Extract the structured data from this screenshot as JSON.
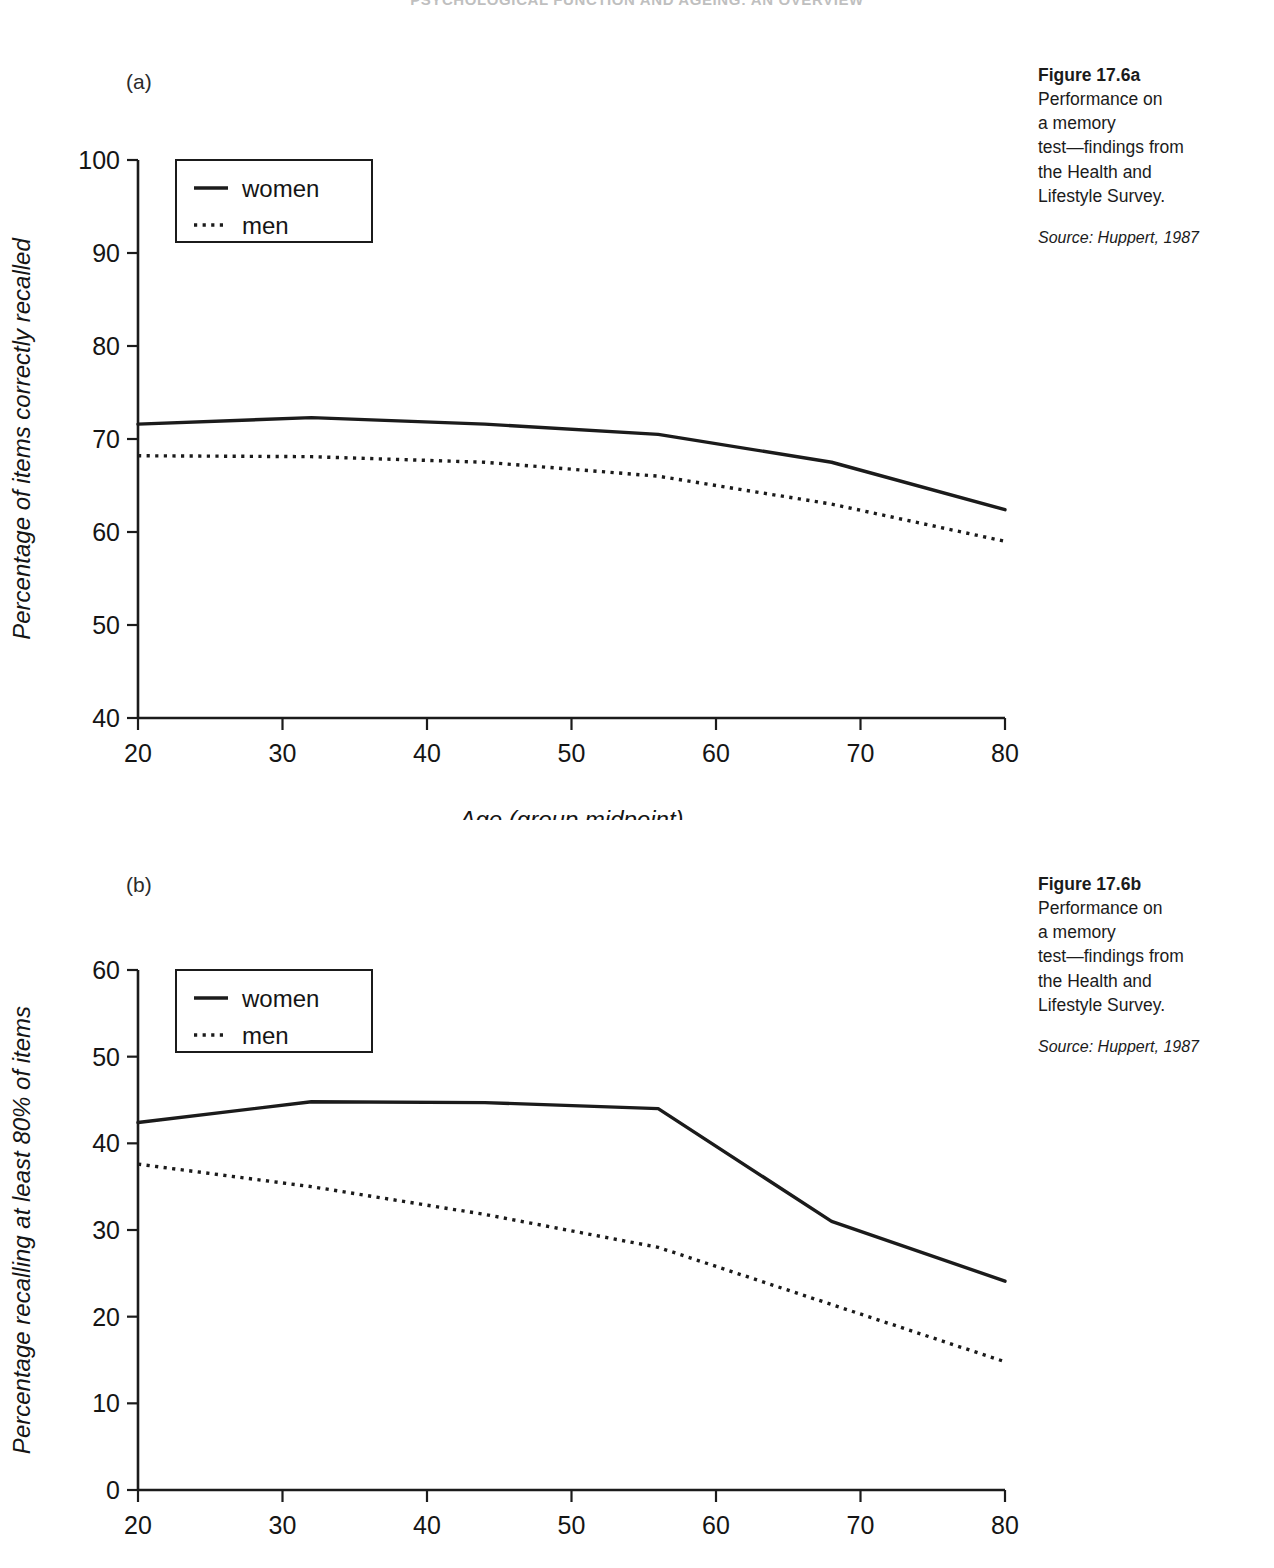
{
  "running_head": "PSYCHOLOGICAL FUNCTION AND AGEING: AN OVERVIEW",
  "panels": {
    "a": {
      "label": "(a)"
    },
    "b": {
      "label": "(b)"
    }
  },
  "captions": {
    "a": {
      "title": "Figure 17.6a",
      "body": "Performance on\na memory\ntest—findings from\nthe Health and\nLifestyle Survey.",
      "source": "Source: Huppert, 1987"
    },
    "b": {
      "title": "Figure 17.6b",
      "body": "Performance on\na memory\ntest—findings from\nthe Health and\nLifestyle Survey.",
      "source": "Source: Huppert, 1987"
    }
  },
  "legend": {
    "women": "women",
    "men": "men"
  },
  "axis_ticks": {
    "x": [
      "20",
      "30",
      "40",
      "50",
      "60",
      "70",
      "80"
    ],
    "y_a": [
      "40",
      "50",
      "60",
      "70",
      "80",
      "90",
      "100"
    ],
    "y_b": [
      "0",
      "10",
      "20",
      "30",
      "40",
      "50",
      "60"
    ]
  },
  "colors": {
    "ink": "#1b1b1b",
    "running_head": "#bfbfbf",
    "background": "#ffffff"
  },
  "chart_data": [
    {
      "id": "figure-17-6a",
      "type": "line",
      "title": "Figure 17.6a",
      "panel": "(a)",
      "xlabel": "Age (group midpoint)",
      "ylabel": "Percentage of items correctly recalled",
      "xlim": [
        20,
        80
      ],
      "ylim": [
        40,
        100
      ],
      "xticks": [
        20,
        30,
        40,
        50,
        60,
        70,
        80
      ],
      "yticks": [
        40,
        50,
        60,
        70,
        80,
        90,
        100
      ],
      "grid": false,
      "legend_position": "upper-left",
      "x": [
        20,
        32,
        44,
        56,
        68,
        80
      ],
      "series": [
        {
          "name": "women",
          "style": "solid",
          "values": [
            71.6,
            72.3,
            71.6,
            70.5,
            67.5,
            62.4
          ]
        },
        {
          "name": "men",
          "style": "dotted",
          "values": [
            68.2,
            68.1,
            67.5,
            66.0,
            63.0,
            59.0
          ]
        }
      ],
      "source": "Source: Huppert, 1987"
    },
    {
      "id": "figure-17-6b",
      "type": "line",
      "title": "Figure 17.6b",
      "panel": "(b)",
      "xlabel": "",
      "ylabel": "Percentage recalling at least 80% of items",
      "xlim": [
        20,
        80
      ],
      "ylim": [
        0,
        60
      ],
      "xticks": [
        20,
        30,
        40,
        50,
        60,
        70,
        80
      ],
      "yticks": [
        0,
        10,
        20,
        30,
        40,
        50,
        60
      ],
      "grid": false,
      "legend_position": "upper-left",
      "x": [
        20,
        32,
        44,
        56,
        68,
        80
      ],
      "series": [
        {
          "name": "women",
          "style": "solid",
          "values": [
            42.4,
            44.8,
            44.7,
            44.0,
            31.0,
            24.1
          ]
        },
        {
          "name": "men",
          "style": "dotted",
          "values": [
            37.6,
            35.0,
            31.8,
            28.0,
            21.4,
            14.8
          ]
        }
      ],
      "source": "Source: Huppert, 1987"
    }
  ]
}
